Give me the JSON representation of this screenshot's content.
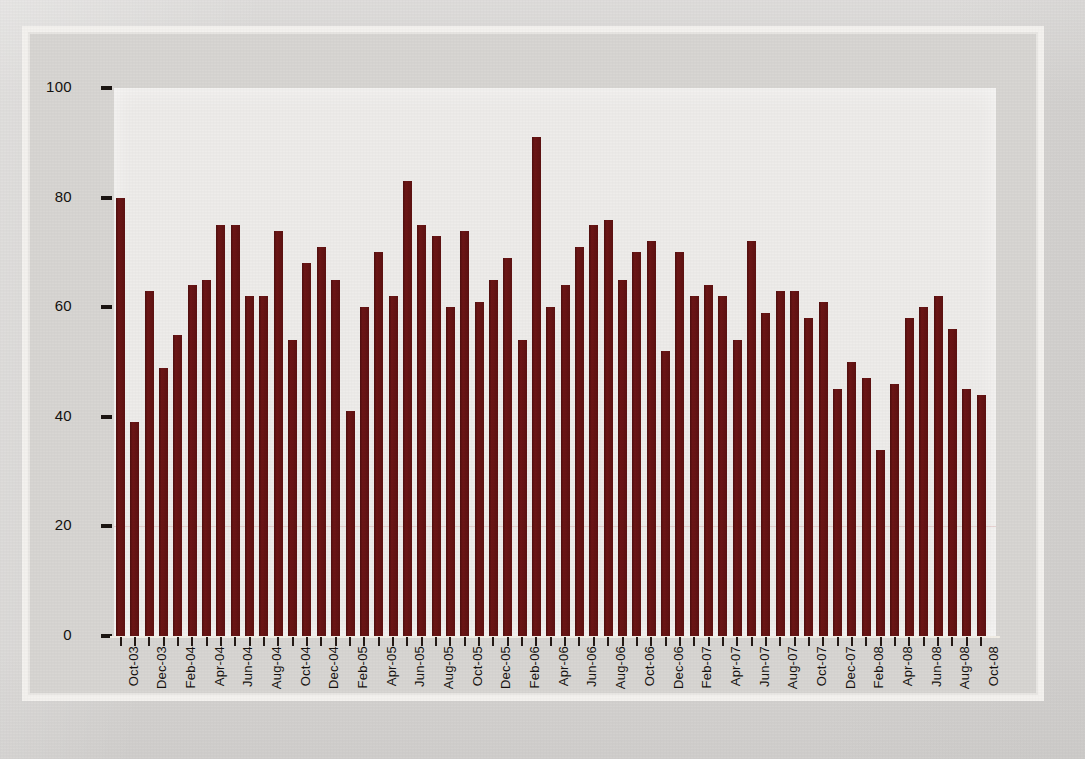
{
  "chart_data": {
    "type": "bar",
    "title": "",
    "xlabel": "",
    "ylabel": "",
    "ylim": [
      0,
      100
    ],
    "ytick_values": [
      0,
      20,
      40,
      60,
      80,
      100
    ],
    "ytick_labels": [
      "0",
      "20",
      "40",
      "60",
      "80",
      "100"
    ],
    "grid": false,
    "legend": "none",
    "bar_color": "#641414",
    "plot_background": "#eeecea",
    "page_background": "#d6d4d2",
    "xtick_label_interval": 2,
    "xtick_label_rotation": -90,
    "categories": [
      "Oct-03",
      "Nov-03",
      "Dec-03",
      "Jan-04",
      "Feb-04",
      "Mar-04",
      "Apr-04",
      "May-04",
      "Jun-04",
      "Jul-04",
      "Aug-04",
      "Sep-04",
      "Oct-04",
      "Nov-04",
      "Dec-04",
      "Jan-05",
      "Feb-05",
      "Mar-05",
      "Apr-05",
      "May-05",
      "Jun-05",
      "Jul-05",
      "Aug-05",
      "Sep-05",
      "Oct-05",
      "Nov-05",
      "Dec-05",
      "Jan-06",
      "Feb-06",
      "Mar-06",
      "Apr-06",
      "May-06",
      "Jun-06",
      "Jul-06",
      "Aug-06",
      "Sep-06",
      "Oct-06",
      "Nov-06",
      "Dec-06",
      "Jan-07",
      "Feb-07",
      "Mar-07",
      "Apr-07",
      "May-07",
      "Jun-07",
      "Jul-07",
      "Aug-07",
      "Sep-07",
      "Oct-07",
      "Nov-07",
      "Dec-07",
      "Jan-08",
      "Feb-08",
      "Mar-08",
      "Apr-08",
      "May-08",
      "Jun-08",
      "Jul-08",
      "Aug-08",
      "Sep-08",
      "Oct-08"
    ],
    "values": [
      80,
      39,
      63,
      49,
      55,
      64,
      65,
      75,
      75,
      62,
      62,
      74,
      54,
      68,
      71,
      65,
      41,
      60,
      70,
      62,
      83,
      75,
      73,
      60,
      74,
      61,
      65,
      69,
      54,
      91,
      60,
      64,
      71,
      75,
      76,
      65,
      70,
      72,
      52,
      70,
      62,
      64,
      62,
      54,
      72,
      59,
      63,
      63,
      58,
      61,
      45,
      50,
      47,
      34,
      46,
      58,
      60,
      62,
      56,
      45,
      44
    ],
    "xtick_labels_shown": [
      "Oct-03",
      "Dec-03",
      "Feb-04",
      "Apr-04",
      "Jun-04",
      "Aug-04",
      "Oct-04",
      "Dec-04",
      "Feb-05",
      "Apr-05",
      "Jun-05",
      "Aug-05",
      "Oct-05",
      "Dec-05",
      "Feb-06",
      "Apr-06",
      "Jun-06",
      "Aug-06",
      "Oct-06",
      "Dec-06",
      "Feb-07",
      "Apr-07",
      "Jun-07",
      "Aug-07",
      "Oct-07",
      "Dec-07",
      "Feb-08",
      "Apr-08",
      "Jun-08",
      "Aug-08",
      "Oct-08"
    ]
  }
}
